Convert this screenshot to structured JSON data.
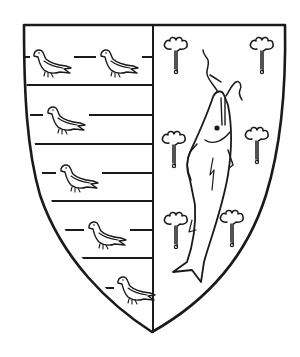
{
  "image": {
    "description": "Heraldic shield (coat of arms), line engraving, per pale",
    "ink_color": "#1a1a1a",
    "background_color": "#ffffff"
  },
  "shield": {
    "division": "per pale",
    "dexter": {
      "field": "barry (horizontal bars)",
      "charges": "martlets (birds)",
      "bird_count": 6,
      "bar_line_count": 9
    },
    "sinister": {
      "charges": "fish (pike/salmon) palewise with trefoils slipped",
      "fish_count": 1,
      "trefoil_count": 6
    }
  }
}
